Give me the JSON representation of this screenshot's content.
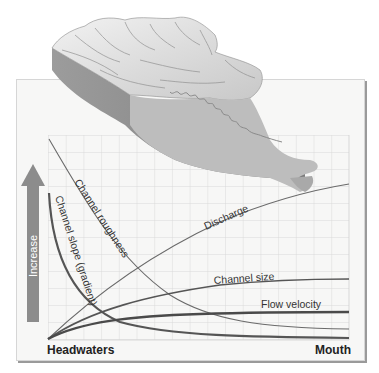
{
  "diagram": {
    "title": "",
    "axis": {
      "y_label": "Increase",
      "x_start_label": "Headwaters",
      "x_end_label": "Mouth"
    },
    "curves": [
      {
        "name": "Channel roughness",
        "label": "Channel roughness",
        "trend": "decreasing"
      },
      {
        "name": "Channel slope (gradient)",
        "label": "Channel slope (gradient)",
        "trend": "decreasing"
      },
      {
        "name": "Discharge",
        "label": "Discharge",
        "trend": "increasing"
      },
      {
        "name": "Channel size",
        "label": "Channel size",
        "trend": "increasing"
      },
      {
        "name": "Flow velocity",
        "label": "Flow velocity",
        "trend": "increasing"
      }
    ],
    "illustration": "3D terrain block of a drainage basin with a meandering river flowing toward the mouth",
    "colors": {
      "panel": "#f7f7f6",
      "grid": "#cfcfcf",
      "thin_curve": "#6a6a6a",
      "thick_curve": "#4a4a4a",
      "arrow": "#8c8c8c",
      "terrain": "#bdbdbd"
    }
  }
}
